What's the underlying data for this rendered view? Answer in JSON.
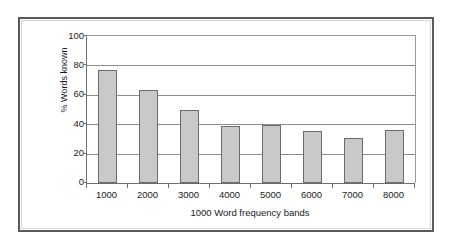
{
  "figure": {
    "frame_border_color": "#5a5a5a",
    "background_color": "#ffffff"
  },
  "chart_data": {
    "type": "bar",
    "title": "",
    "subtitle": "",
    "xlabel": "1000 Word frequency bands",
    "ylabel": "% Words known",
    "categories": [
      "1000",
      "2000",
      "3000",
      "4000",
      "5000",
      "6000",
      "7000",
      "8000"
    ],
    "values": [
      77,
      63,
      49.5,
      38.5,
      39.5,
      35.5,
      30.5,
      36
    ],
    "ylim": [
      0,
      100
    ],
    "ytick_labels": [
      "100",
      "80",
      "60",
      "40",
      "20",
      "0"
    ],
    "ytick_values": [
      100,
      80,
      60,
      40,
      20,
      0
    ],
    "grid": true,
    "gridlines_at": [
      100,
      80,
      60,
      40,
      20,
      0
    ],
    "legend": false,
    "legend_position": "none",
    "bar_fill_color": "#c9c9c9",
    "bar_border_color": "#6b6b6b",
    "gridline_color": "#8c8c8c",
    "axis_color": "#6e6e6e",
    "annotations": []
  }
}
